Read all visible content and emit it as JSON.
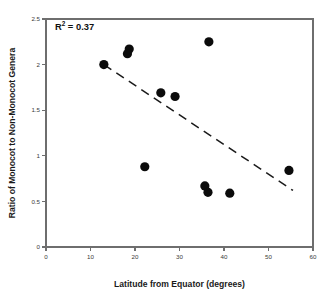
{
  "chart_data": {
    "type": "scatter",
    "title": "",
    "xlabel": "Latitude from Equator (degrees)",
    "ylabel": "Ratio of Monocot to Non-Monocot Genera",
    "xlim": [
      0,
      60
    ],
    "ylim": [
      0,
      2.5
    ],
    "xticks": [
      0,
      10,
      20,
      30,
      40,
      50,
      60
    ],
    "xtick_labels": [
      "0",
      "10",
      "20",
      "30",
      "40",
      "50",
      "60"
    ],
    "yticks": [
      0,
      0.5,
      1,
      1.5,
      2,
      2.5
    ],
    "ytick_labels": [
      "0",
      "0.5",
      "1",
      "1.5",
      "2",
      "2.5"
    ],
    "grid": false,
    "legend": "none",
    "marker": "filled-circle",
    "marker_color": "#0b0b0b",
    "marker_size": 4.6,
    "points": [
      {
        "x": 13.0,
        "y": 2.0
      },
      {
        "x": 18.7,
        "y": 2.17
      },
      {
        "x": 18.3,
        "y": 2.12
      },
      {
        "x": 22.2,
        "y": 0.88
      },
      {
        "x": 25.8,
        "y": 1.69
      },
      {
        "x": 29.0,
        "y": 1.65
      },
      {
        "x": 36.6,
        "y": 2.25
      },
      {
        "x": 35.7,
        "y": 0.67
      },
      {
        "x": 36.4,
        "y": 0.6
      },
      {
        "x": 41.3,
        "y": 0.59
      },
      {
        "x": 54.6,
        "y": 0.84
      }
    ],
    "trend_line": {
      "style": "dashed",
      "color": "#1a1a1a",
      "x_start": 13.0,
      "y_start": 2.0,
      "x_end": 55.5,
      "y_end": 0.62
    },
    "annotations": [
      {
        "name": "r-squared",
        "base": "R",
        "superscript": "2",
        "rest": " = 0.37",
        "full_text": "R2 = 0.37",
        "x": 2.0,
        "y": 2.38
      }
    ]
  }
}
